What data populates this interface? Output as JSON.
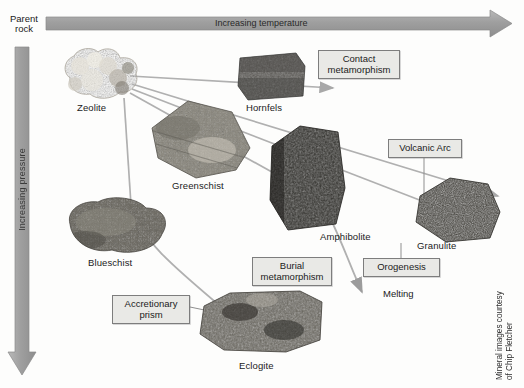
{
  "figure": {
    "background_color": "#fdfdfc",
    "arrow_color": "#9a9a9a",
    "callout_fill": "#e9e9e6",
    "callout_border": "#7d7d7d"
  },
  "axes": {
    "horizontal": {
      "label": "Increasing temperature",
      "direction": "right",
      "origin_label": "Parent\nrock"
    },
    "vertical": {
      "label": "Increasing pressure",
      "direction": "down"
    }
  },
  "rocks": [
    {
      "id": "zeolite",
      "label": "Zeolite"
    },
    {
      "id": "hornfels",
      "label": "Hornfels"
    },
    {
      "id": "greenschist",
      "label": "Greenschist"
    },
    {
      "id": "amphibolite",
      "label": "Amphibolite"
    },
    {
      "id": "granulite",
      "label": "Granulite"
    },
    {
      "id": "blueschist",
      "label": "Blueschist"
    },
    {
      "id": "eclogite",
      "label": "Eclogite"
    }
  ],
  "callouts": [
    {
      "id": "contact-metamorphism",
      "label": "Contact\nmetamorphism"
    },
    {
      "id": "volcanic-arc",
      "label": "Volcanic Arc"
    },
    {
      "id": "burial-metamorphism",
      "label": "Burial\nmetamorphism"
    },
    {
      "id": "orogenesis",
      "label": "Orogenesis"
    },
    {
      "id": "accretionary-prism",
      "label": "Accretionary\nprism"
    }
  ],
  "annotations": {
    "melting": "Melting",
    "credit": "Mineral images courtesy\nof Chip Fletcher"
  }
}
